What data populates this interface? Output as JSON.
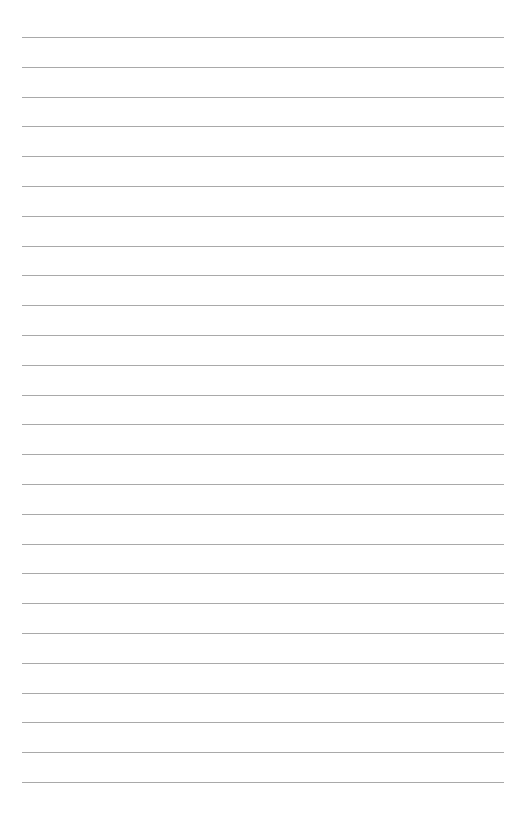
{
  "page": {
    "type": "lined-paper",
    "background_color": "#ffffff",
    "line_color": "#a9a9a9",
    "line_count": 26,
    "line_left": 22,
    "line_right": 504,
    "first_line_y": 37,
    "line_spacing": 29.8
  }
}
